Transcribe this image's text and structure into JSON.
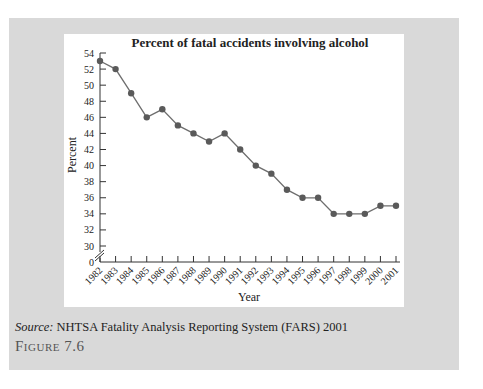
{
  "figure": {
    "source_label": "Source:",
    "source_text": " NHTSA Fatality Analysis Reporting System (FARS) 2001",
    "figure_word": "Figure",
    "figure_number": " 7.6"
  },
  "colors": {
    "panel": "#d9d9d9",
    "line": "#6e6e6e",
    "marker": "#5a5a5a",
    "axis": "#333333"
  },
  "chart_data": {
    "type": "line",
    "title": "Percent of fatal accidents involving alcohol",
    "xlabel": "Year",
    "ylabel": "Percent",
    "x": [
      "1982",
      "1983",
      "1984",
      "1985",
      "1986",
      "1987",
      "1988",
      "1989",
      "1990",
      "1991",
      "1992",
      "1993",
      "1994",
      "1995",
      "1996",
      "1997",
      "1998",
      "1999",
      "2000",
      "2001"
    ],
    "series": [
      {
        "name": "Percent of fatal accidents involving alcohol",
        "values": [
          53,
          52,
          49,
          46,
          47,
          45,
          44,
          43,
          44,
          42,
          40,
          39,
          37,
          36,
          36,
          34,
          34,
          34,
          35,
          35
        ]
      }
    ],
    "yticks": [
      0,
      30,
      32,
      34,
      36,
      38,
      40,
      42,
      44,
      46,
      48,
      50,
      52,
      54
    ],
    "ylim": [
      30,
      54
    ],
    "axis_break": true,
    "grid": false,
    "legend": "none",
    "source": "NHTSA Fatality Analysis Reporting System (FARS) 2001",
    "caption": "Figure 7.6"
  }
}
